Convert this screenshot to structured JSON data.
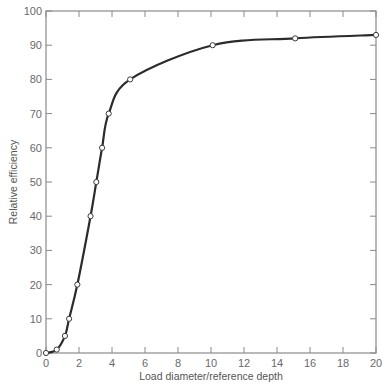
{
  "chart_data": {
    "type": "line",
    "title": "",
    "xlabel": "Load diameter/reference depth",
    "ylabel": "Relative efficiency",
    "xlim": [
      0,
      20
    ],
    "ylim": [
      0,
      100
    ],
    "x_ticks": [
      0,
      2,
      4,
      6,
      8,
      10,
      12,
      14,
      16,
      18,
      20
    ],
    "y_ticks": [
      0,
      10,
      20,
      30,
      40,
      50,
      60,
      70,
      80,
      90,
      100
    ],
    "grid": false,
    "legend": null,
    "series": [
      {
        "name": "Relative efficiency",
        "markers": "open-circle",
        "x": [
          0,
          0.65,
          1.15,
          1.4,
          1.9,
          2.7,
          3.05,
          3.4,
          3.8,
          5.1,
          10.1,
          15.1,
          20
        ],
        "y": [
          0,
          1,
          5,
          10,
          20,
          40,
          50,
          60,
          70,
          80,
          90,
          92,
          93
        ]
      }
    ]
  },
  "colors": {
    "line": "#2b2b2b",
    "axis": "#8a8a8a",
    "marker_fill": "#ffffff",
    "text": "#6a6a6a"
  }
}
